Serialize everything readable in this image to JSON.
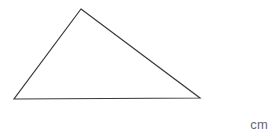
{
  "figure": {
    "type": "geometry-diagram",
    "shape_name": "triangle",
    "background_color": "#ffffff",
    "stroke_color": "#3a3a3a",
    "stroke_width": 1.2,
    "fill": "none",
    "canvas": {
      "width": 276,
      "height": 136
    },
    "vertices": [
      {
        "label": "apex",
        "x": 81,
        "y": 9
      },
      {
        "label": "bottom-right",
        "x": 200,
        "y": 98
      },
      {
        "label": "bottom-left",
        "x": 14,
        "y": 99
      }
    ],
    "polygon_points": "81,9 200,98 14,99",
    "edges": [
      {
        "name": "left-side",
        "from": "bottom-left",
        "to": "apex"
      },
      {
        "name": "right-side",
        "from": "apex",
        "to": "bottom-right"
      },
      {
        "name": "base",
        "from": "bottom-right",
        "to": "bottom-left"
      }
    ]
  },
  "labels": {
    "unit": "cm",
    "unit_color": "#6a6a6a"
  }
}
